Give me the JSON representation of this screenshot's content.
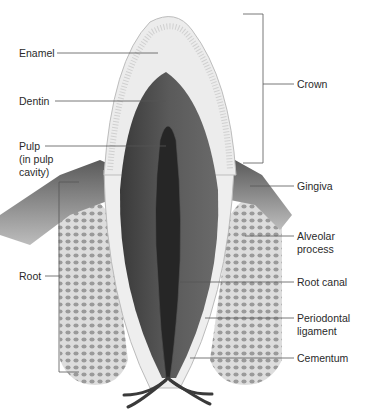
{
  "figure": {
    "colors": {
      "background": "#ffffff",
      "enamel": "#e6e6e6",
      "dentin": "#4a4a4a",
      "pulp": "#2a2a2a",
      "bone": "#cfcfcf",
      "gingiva": "#7a7a7a",
      "leader_line": "#555555"
    }
  },
  "labels": {
    "left": [
      {
        "id": "enamel",
        "text": "Enamel"
      },
      {
        "id": "dentin",
        "text": "Dentin"
      },
      {
        "id": "pulp",
        "lines": [
          "Pulp",
          "(in pulp",
          "cavity)"
        ]
      },
      {
        "id": "root",
        "text": "Root"
      }
    ],
    "right": [
      {
        "id": "crown",
        "text": "Crown"
      },
      {
        "id": "gingiva",
        "text": "Gingiva"
      },
      {
        "id": "alveolar",
        "lines": [
          "Alveolar",
          "process"
        ]
      },
      {
        "id": "root_canal",
        "text": "Root canal"
      },
      {
        "id": "periodontal",
        "lines": [
          "Periodontal",
          "ligament"
        ]
      },
      {
        "id": "cementum",
        "text": "Cementum"
      }
    ]
  }
}
